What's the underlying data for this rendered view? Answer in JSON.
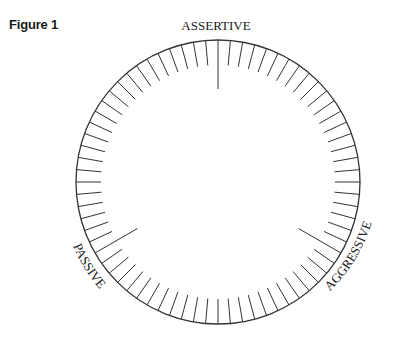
{
  "figure": {
    "label": "Figure 1"
  },
  "dial": {
    "center": [
      218,
      182
    ],
    "radius": 142,
    "tick_count": 72,
    "tick_step_deg": 5,
    "short_tick_length": 25,
    "long_tick_length": 49,
    "line_color": "#333333",
    "markers": [
      {
        "label": "ASSERTIVE",
        "angle_deg": 0
      },
      {
        "label": "AGGRESSIVE",
        "angle_deg": 120
      },
      {
        "label": "PASSIVE",
        "angle_deg": 240
      }
    ]
  }
}
